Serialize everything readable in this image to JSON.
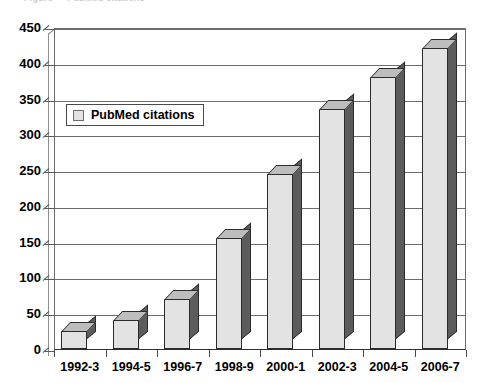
{
  "caption_fragment": "Figure — PubMed citations",
  "legend": {
    "position": "inside-top-left",
    "entries": [
      {
        "label": "PubMed citations",
        "color": "#e3e3e3"
      }
    ]
  },
  "axis": {
    "y_ticks": [
      0,
      50,
      100,
      150,
      200,
      250,
      300,
      350,
      400,
      450
    ],
    "x_ticks": [
      "1992-3",
      "1994-5",
      "1996-7",
      "1998-9",
      "2000-1",
      "2002-3",
      "2004-5",
      "2006-7"
    ]
  },
  "colors": {
    "bar_front": "#e3e3e3",
    "bar_top": "#bdbdbd",
    "bar_side": "#5c5c5c",
    "bar_outline": "#2b2b2b",
    "gridline": "#6d6d6d",
    "axis": "#2e2e2e",
    "text": "#000000"
  },
  "chart_data": {
    "type": "bar",
    "title": "",
    "xlabel": "",
    "ylabel": "",
    "categories": [
      "1992-3",
      "1994-5",
      "1996-7",
      "1998-9",
      "2000-1",
      "2002-3",
      "2004-5",
      "2006-7"
    ],
    "series": [
      {
        "name": "PubMed citations",
        "values": [
          25,
          40,
          70,
          155,
          245,
          335,
          380,
          420
        ]
      }
    ],
    "ylim": [
      0,
      450
    ],
    "ytick_step": 50,
    "grid": true,
    "grid_axis": "y",
    "legend_position": "inside-top-left",
    "style": "3d-column"
  }
}
